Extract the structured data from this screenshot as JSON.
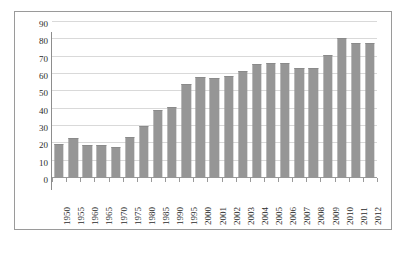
{
  "chart_data": {
    "type": "bar",
    "title": "",
    "subtitle": "",
    "xlabel": "",
    "ylabel": "",
    "ylim": [
      0,
      90
    ],
    "ytick_step": 10,
    "yticks": [
      90,
      80,
      70,
      60,
      50,
      40,
      30,
      20,
      10,
      0
    ],
    "grid": true,
    "grid_axis": "y",
    "legend": false,
    "legend_position": "none",
    "bar_color": "#969696",
    "gridline_color": "#d9d9d9",
    "axis_color": "#9a9a9a",
    "categories": [
      "1950",
      "1955",
      "1960",
      "1965",
      "1970",
      "1975",
      "1980",
      "1985",
      "1990",
      "1995",
      "2000",
      "2001",
      "2002",
      "2003",
      "2004",
      "2005",
      "2006",
      "2007",
      "2008",
      "2009",
      "2010",
      "2011",
      "2012"
    ],
    "values": [
      19.5,
      23,
      19,
      19,
      18,
      23.5,
      30,
      39,
      41,
      54.5,
      58.5,
      57.5,
      59,
      62,
      65.5,
      66.5,
      66.5,
      63.5,
      63.5,
      71,
      81,
      78,
      78
    ],
    "series": [
      {
        "name": "",
        "values": [
          19.5,
          23,
          19,
          19,
          18,
          23.5,
          30,
          39,
          41,
          54.5,
          58.5,
          57.5,
          59,
          62,
          65.5,
          66.5,
          66.5,
          63.5,
          63.5,
          71,
          81,
          78,
          78
        ]
      }
    ]
  }
}
